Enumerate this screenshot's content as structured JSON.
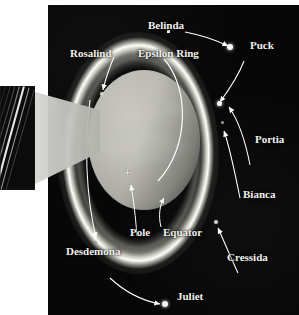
{
  "figure": {
    "background_color": "#ffffff",
    "panel_color": "#070707",
    "label_color": "#f2f2ee",
    "planet_color": "#bcbcb4",
    "ring_color": "#fffffa"
  },
  "labels": {
    "belinda": "Belinda",
    "puck": "Puck",
    "rosalind": "Rosalind",
    "epsilon_ring": "Epsilon Ring",
    "portia": "Portia",
    "bianca": "Bianca",
    "cressida": "Cressida",
    "desdemona": "Desdemona",
    "juliet": "Juliet",
    "pole": "Pole",
    "equator": "Equator"
  },
  "markers": {
    "pole_cross": "+",
    "belinda_marker": "belinda-square-marker"
  },
  "annotations": [
    {
      "name": "belinda",
      "label": "Belinda",
      "kind": "moon-label",
      "side": "top"
    },
    {
      "name": "puck",
      "label": "Puck",
      "kind": "moon-label",
      "side": "top-right"
    },
    {
      "name": "rosalind",
      "label": "Rosalind",
      "kind": "moon-label",
      "side": "top-left"
    },
    {
      "name": "epsilon-ring",
      "label": "Epsilon Ring",
      "kind": "ring-label",
      "side": "top"
    },
    {
      "name": "portia",
      "label": "Portia",
      "kind": "moon-label",
      "side": "right"
    },
    {
      "name": "bianca",
      "label": "Bianca",
      "kind": "moon-label",
      "side": "right"
    },
    {
      "name": "cressida",
      "label": "Cressida",
      "kind": "moon-label",
      "side": "bottom-right"
    },
    {
      "name": "desdemona",
      "label": "Desdemona",
      "kind": "moon-label",
      "side": "bottom-left"
    },
    {
      "name": "juliet",
      "label": "Juliet",
      "kind": "moon-label",
      "side": "bottom"
    },
    {
      "name": "pole",
      "label": "Pole",
      "kind": "planet-feature",
      "side": "bottom-center"
    },
    {
      "name": "equator",
      "label": "Equator",
      "kind": "planet-feature",
      "side": "bottom-center"
    }
  ],
  "inset": {
    "name": "ring-closeup-inset",
    "description": "magnified view of the ring system"
  }
}
